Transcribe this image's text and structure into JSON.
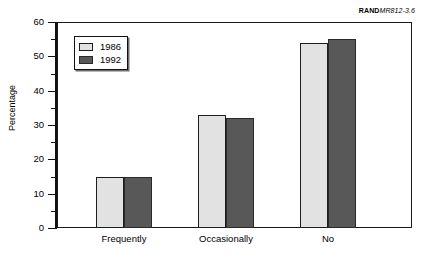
{
  "source_tag": {
    "brand": "RAND",
    "document_id": "MR812-3.6"
  },
  "chart_data": {
    "type": "bar",
    "title": "",
    "subtitle": "",
    "xlabel": "",
    "ylabel": "Percentage",
    "categories": [
      "Frequently",
      "Occasionally",
      "No"
    ],
    "series": [
      {
        "name": "1986",
        "color": "#e2e2e2",
        "values": [
          15,
          33,
          54
        ]
      },
      {
        "name": "1992",
        "color": "#585858",
        "values": [
          15,
          32,
          55
        ]
      }
    ],
    "ylim": [
      0,
      60
    ],
    "y_major_ticks": [
      0,
      10,
      20,
      30,
      40,
      50,
      60
    ],
    "y_minor_ticks": [
      5,
      15,
      25,
      35,
      45,
      55
    ],
    "y_tick_labels": [
      "0",
      "10",
      "20",
      "30",
      "40",
      "50",
      "60"
    ],
    "grid": false,
    "legend_position": "top-left",
    "frame": true,
    "background_color": "#ffffff"
  }
}
